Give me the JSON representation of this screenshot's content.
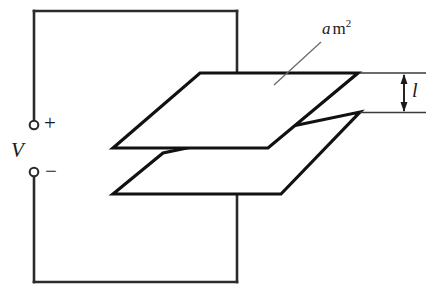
{
  "figure": {
    "labels": {
      "voltage_source": "V",
      "positive_terminal": "+",
      "negative_terminal": "−",
      "separation": "l",
      "plate_area_symbol": "a",
      "plate_area_unit": "m",
      "plate_area_exponent": "2"
    },
    "colors": {
      "background": "#ffffff",
      "ink": "#1a1a1a",
      "wire": "#2b2b2b",
      "leader": "#6b6b6b",
      "plate_edge": "#111111"
    },
    "geometry": {
      "circuit_rect": {
        "left": 34,
        "top": 11,
        "right": 237,
        "bottom": 282
      },
      "terminal_gap": {
        "top_circle_y": 125,
        "bottom_circle_y": 172,
        "x": 34,
        "radius": 4.5
      },
      "top_plate": [
        [
          113,
          148
        ],
        [
          200,
          73
        ],
        [
          358,
          73
        ],
        [
          268,
          148
        ]
      ],
      "bottom_plate": [
        [
          113,
          194
        ],
        [
          163,
          153
        ],
        [
          360,
          112
        ],
        [
          281,
          194
        ]
      ],
      "dimension_lines": {
        "upper_y": 73,
        "lower_y": 112,
        "x_start": 360,
        "x_end": 426,
        "arrow_x": 404
      },
      "leader_line": {
        "x1": 274,
        "y1": 85,
        "x2": 321,
        "y2": 42
      }
    }
  }
}
